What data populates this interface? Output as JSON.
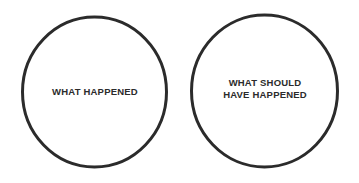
{
  "canvas": {
    "width": 359,
    "height": 183,
    "background_color": "#ffffff"
  },
  "style": {
    "stroke_color": "#2b2b2b",
    "stroke_width": 3,
    "text_color": "#2b2b2b",
    "fill_color": "#ffffff"
  },
  "diagram": {
    "type": "two-circle-diagram",
    "circles": [
      {
        "id": "left",
        "label": "WHAT HAPPENED",
        "cx": 94.5,
        "cy": 92,
        "rx": 72,
        "ry": 75
      },
      {
        "id": "right",
        "label": "WHAT SHOULD\nHAVE HAPPENED",
        "cx": 264.5,
        "cy": 91,
        "rx": 73,
        "ry": 76
      }
    ]
  }
}
